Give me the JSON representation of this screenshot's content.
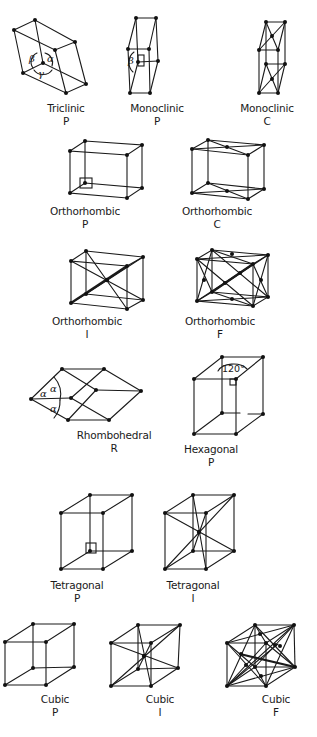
{
  "figure": {
    "ink_color": "#1a1a1a",
    "background": "#ffffff"
  },
  "lattices": [
    {
      "system": "Triclinic",
      "centering": "P",
      "angles": [
        "β",
        "α",
        "γ"
      ]
    },
    {
      "system": "Monoclinic",
      "centering": "P",
      "angles": [
        "β"
      ]
    },
    {
      "system": "Monoclinic",
      "centering": "C"
    },
    {
      "system": "Orthorhombic",
      "centering": "P"
    },
    {
      "system": "Orthorhombic",
      "centering": "C"
    },
    {
      "system": "Orthorhombic",
      "centering": "I"
    },
    {
      "system": "Orthorhombic",
      "centering": "F"
    },
    {
      "system": "Rhombohedral",
      "centering": "R",
      "angles": [
        "α",
        "α",
        "α"
      ]
    },
    {
      "system": "Hexagonal",
      "centering": "P",
      "angles": [
        "120°"
      ]
    },
    {
      "system": "Tetragonal",
      "centering": "P"
    },
    {
      "system": "Tetragonal",
      "centering": "I"
    },
    {
      "system": "Cubic",
      "centering": "P"
    },
    {
      "system": "Cubic",
      "centering": "I"
    },
    {
      "system": "Cubic",
      "centering": "F"
    }
  ]
}
